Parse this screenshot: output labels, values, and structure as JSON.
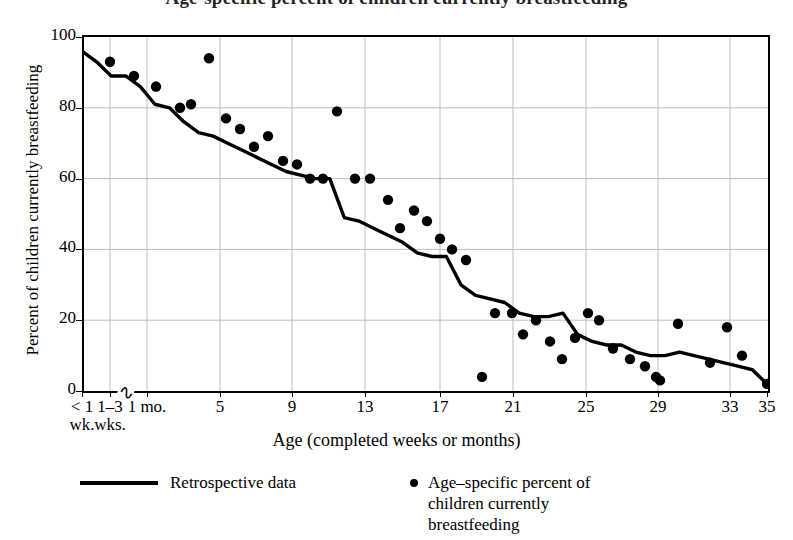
{
  "title": "Age-specific percent of children currently breastfeeding",
  "chart_data": {
    "type": "scatter",
    "title": "Age-specific percent of children currently breastfeeding",
    "xlabel": "Age (completed weeks or months)",
    "ylabel": "Percent of children currently breastfeeding",
    "ylim": [
      0,
      100
    ],
    "yticks": [
      0,
      20,
      40,
      60,
      80,
      100
    ],
    "grid": true,
    "legend_position": "below",
    "axis_break_after_category": "1-3 wks.",
    "xtick_labels": [
      {
        "line1": "< 1",
        "line2": "wk.",
        "px": 82
      },
      {
        "line1": "1–3",
        "line2": "wks.",
        "px": 110
      },
      {
        "line1": "1 mo.",
        "line2": "",
        "px": 147
      },
      {
        "line1": "5",
        "line2": "",
        "px": 220
      },
      {
        "line1": "9",
        "line2": "",
        "px": 292
      },
      {
        "line1": "13",
        "line2": "",
        "px": 365
      },
      {
        "line1": "17",
        "line2": "",
        "px": 440
      },
      {
        "line1": "21",
        "line2": "",
        "px": 513
      },
      {
        "line1": "25",
        "line2": "",
        "px": 586
      },
      {
        "line1": "29",
        "line2": "",
        "px": 658
      },
      {
        "line1": "33",
        "line2": "",
        "px": 730
      },
      {
        "line1": "35",
        "line2": "",
        "px": 767
      }
    ],
    "vertical_gridlines_px": [
      110,
      147,
      220,
      292,
      365,
      440,
      513,
      586,
      658,
      730
    ],
    "series": [
      {
        "name": "Retrospective data",
        "type": "line",
        "color": "#000000",
        "points": [
          {
            "x": 0,
            "y": 96
          },
          {
            "x": 1,
            "y": 93
          },
          {
            "x": 2,
            "y": 89
          },
          {
            "x": 3,
            "y": 89
          },
          {
            "x": 4,
            "y": 86
          },
          {
            "x": 5,
            "y": 81
          },
          {
            "x": 6,
            "y": 80
          },
          {
            "x": 7,
            "y": 76
          },
          {
            "x": 8,
            "y": 73
          },
          {
            "x": 9,
            "y": 72
          },
          {
            "x": 10,
            "y": 70
          },
          {
            "x": 11,
            "y": 68
          },
          {
            "x": 12,
            "y": 66
          },
          {
            "x": 13,
            "y": 64
          },
          {
            "x": 14,
            "y": 62
          },
          {
            "x": 15,
            "y": 61
          },
          {
            "x": 16,
            "y": 60
          },
          {
            "x": 17,
            "y": 60
          },
          {
            "x": 18,
            "y": 49
          },
          {
            "x": 19,
            "y": 48
          },
          {
            "x": 20,
            "y": 46
          },
          {
            "x": 21,
            "y": 44
          },
          {
            "x": 22,
            "y": 42
          },
          {
            "x": 23,
            "y": 39
          },
          {
            "x": 24,
            "y": 38
          },
          {
            "x": 25,
            "y": 38
          },
          {
            "x": 26,
            "y": 30
          },
          {
            "x": 27,
            "y": 27
          },
          {
            "x": 28,
            "y": 26
          },
          {
            "x": 29,
            "y": 25
          },
          {
            "x": 30,
            "y": 22
          },
          {
            "x": 31,
            "y": 21
          },
          {
            "x": 32,
            "y": 21
          },
          {
            "x": 33,
            "y": 22
          },
          {
            "x": 34,
            "y": 16
          },
          {
            "x": 35,
            "y": 14
          },
          {
            "x": 36,
            "y": 13
          },
          {
            "x": 37,
            "y": 13
          },
          {
            "x": 38,
            "y": 11
          },
          {
            "x": 39,
            "y": 10
          },
          {
            "x": 40,
            "y": 10
          },
          {
            "x": 41,
            "y": 11
          },
          {
            "x": 42,
            "y": 10
          },
          {
            "x": 43,
            "y": 9
          },
          {
            "x": 44,
            "y": 8
          },
          {
            "x": 45,
            "y": 7
          },
          {
            "x": 46,
            "y": 6
          },
          {
            "x": 47,
            "y": 2
          }
        ]
      },
      {
        "name": "Age-specific percent of children currently breastfeeding",
        "type": "scatter",
        "color": "#000000",
        "points": [
          {
            "px": 110,
            "y": 93
          },
          {
            "px": 134,
            "y": 89
          },
          {
            "px": 156,
            "y": 86
          },
          {
            "px": 180,
            "y": 80
          },
          {
            "px": 191,
            "y": 81
          },
          {
            "px": 209,
            "y": 94
          },
          {
            "px": 226,
            "y": 77
          },
          {
            "px": 240,
            "y": 74
          },
          {
            "px": 254,
            "y": 69
          },
          {
            "px": 268,
            "y": 72
          },
          {
            "px": 283,
            "y": 65
          },
          {
            "px": 297,
            "y": 64
          },
          {
            "px": 310,
            "y": 60
          },
          {
            "px": 323,
            "y": 60
          },
          {
            "px": 337,
            "y": 79
          },
          {
            "px": 355,
            "y": 60
          },
          {
            "px": 370,
            "y": 60
          },
          {
            "px": 388,
            "y": 54
          },
          {
            "px": 400,
            "y": 46
          },
          {
            "px": 414,
            "y": 51
          },
          {
            "px": 427,
            "y": 48
          },
          {
            "px": 440,
            "y": 43
          },
          {
            "px": 452,
            "y": 40
          },
          {
            "px": 466,
            "y": 37
          },
          {
            "px": 482,
            "y": 4
          },
          {
            "px": 495,
            "y": 22
          },
          {
            "px": 512,
            "y": 22
          },
          {
            "px": 523,
            "y": 16
          },
          {
            "px": 536,
            "y": 20
          },
          {
            "px": 550,
            "y": 14
          },
          {
            "px": 562,
            "y": 9
          },
          {
            "px": 575,
            "y": 15
          },
          {
            "px": 588,
            "y": 22
          },
          {
            "px": 599,
            "y": 20
          },
          {
            "px": 613,
            "y": 12
          },
          {
            "px": 630,
            "y": 9
          },
          {
            "px": 645,
            "y": 7
          },
          {
            "px": 656,
            "y": 4
          },
          {
            "px": 660,
            "y": 3
          },
          {
            "px": 678,
            "y": 19
          },
          {
            "px": 710,
            "y": 8
          },
          {
            "px": 727,
            "y": 18
          },
          {
            "px": 742,
            "y": 10
          },
          {
            "px": 767,
            "y": 2
          }
        ]
      }
    ]
  },
  "legend": {
    "line_label": "Retrospective data",
    "dot_label_line1": "Age–specific percent of",
    "dot_label_line2": "children currently",
    "dot_label_line3": "breastfeeding"
  }
}
